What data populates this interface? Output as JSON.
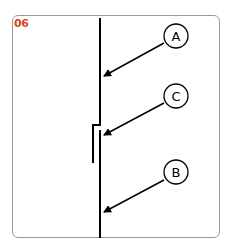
{
  "figure": {
    "number": "06",
    "number_color": "#d9441c"
  },
  "labels": {
    "a": "A",
    "b": "B",
    "c": "C"
  }
}
